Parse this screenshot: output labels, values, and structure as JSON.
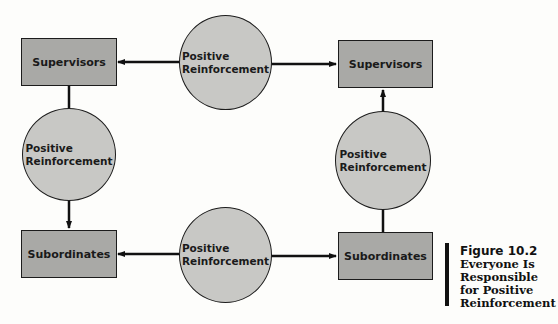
{
  "diagram": {
    "boxes": {
      "top_left": "Supervisors",
      "top_right": "Supervisors",
      "bottom_left": "Subordinates",
      "bottom_right": "Subordinates"
    },
    "circles": {
      "top": [
        "Positive",
        "Reinforcement"
      ],
      "left": [
        "Positive",
        "Reinforcement"
      ],
      "right": [
        "Positive",
        "Reinforcement"
      ],
      "bottom": [
        "Positive",
        "Reinforcement"
      ]
    },
    "colors": {
      "box_fill": "#a9a9a6",
      "circle_fill": "#c8c8c5",
      "stroke": "#1c1c1c"
    }
  },
  "caption": {
    "figure_label": "Figure 10.2",
    "lines": [
      "Everyone Is",
      "Responsible",
      "for Positive",
      "Reinforcement"
    ]
  }
}
